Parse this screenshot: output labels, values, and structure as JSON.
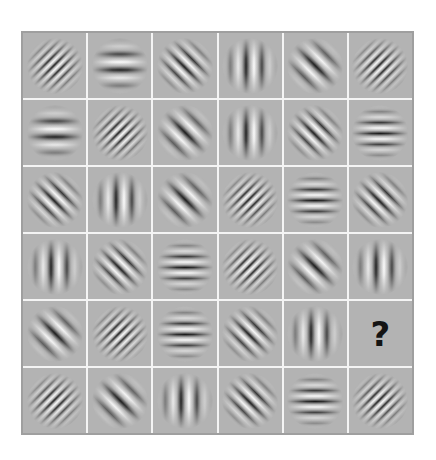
{
  "puzzle": {
    "description": "6x6 matrix of Gabor patches with one missing cell",
    "missing_symbol": "?",
    "missing_cell": {
      "row": 5,
      "col": 6
    },
    "colors": {
      "cell_background": "#b3b3b3",
      "grid_lines": "#f4f4f4",
      "outer_border": "#9f9f9f",
      "stripe_dark": "#1a1a1a",
      "stripe_light": "#ffffff",
      "question_mark": "#141414"
    },
    "frequency_periods_px": {
      "low": 16,
      "med": 11,
      "high": 7
    },
    "rows": [
      [
        {
          "orientation": 45,
          "freq": "high"
        },
        {
          "orientation": 0,
          "freq": "low"
        },
        {
          "orientation": 135,
          "freq": "med"
        },
        {
          "orientation": 90,
          "freq": "low"
        },
        {
          "orientation": 135,
          "freq": "low"
        },
        {
          "orientation": 45,
          "freq": "high"
        }
      ],
      [
        {
          "orientation": 0,
          "freq": "low"
        },
        {
          "orientation": 45,
          "freq": "high"
        },
        {
          "orientation": 135,
          "freq": "low"
        },
        {
          "orientation": 90,
          "freq": "low"
        },
        {
          "orientation": 135,
          "freq": "med"
        },
        {
          "orientation": 0,
          "freq": "med"
        }
      ],
      [
        {
          "orientation": 135,
          "freq": "med"
        },
        {
          "orientation": 90,
          "freq": "low"
        },
        {
          "orientation": 135,
          "freq": "low"
        },
        {
          "orientation": 45,
          "freq": "high"
        },
        {
          "orientation": 0,
          "freq": "med"
        },
        {
          "orientation": 135,
          "freq": "med"
        }
      ],
      [
        {
          "orientation": 90,
          "freq": "low"
        },
        {
          "orientation": 135,
          "freq": "med"
        },
        {
          "orientation": 0,
          "freq": "med"
        },
        {
          "orientation": 45,
          "freq": "high"
        },
        {
          "orientation": 135,
          "freq": "low"
        },
        {
          "orientation": 90,
          "freq": "low"
        }
      ],
      [
        {
          "orientation": 135,
          "freq": "low"
        },
        {
          "orientation": 45,
          "freq": "high"
        },
        {
          "orientation": 0,
          "freq": "med"
        },
        {
          "orientation": 135,
          "freq": "med"
        },
        {
          "orientation": 90,
          "freq": "low"
        },
        {
          "missing": true
        }
      ],
      [
        {
          "orientation": 45,
          "freq": "high"
        },
        {
          "orientation": 135,
          "freq": "low"
        },
        {
          "orientation": 90,
          "freq": "low"
        },
        {
          "orientation": 135,
          "freq": "med"
        },
        {
          "orientation": 0,
          "freq": "med"
        },
        {
          "orientation": 45,
          "freq": "high"
        }
      ]
    ]
  }
}
